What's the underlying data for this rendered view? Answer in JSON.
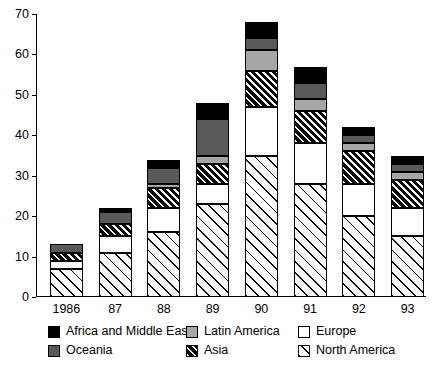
{
  "chart_data": {
    "type": "bar",
    "title": "",
    "subtitle": "",
    "xlabel": "",
    "ylabel": "",
    "stacked": true,
    "grid": false,
    "legend_position": "bottom",
    "categories": [
      "1986",
      "87",
      "88",
      "89",
      "90",
      "91",
      "92",
      "93"
    ],
    "ylim": [
      0,
      70
    ],
    "yticks": [
      0,
      10,
      20,
      30,
      40,
      50,
      60,
      70
    ],
    "ytick_labels": [
      "0",
      "10",
      "20",
      "30",
      "40",
      "50",
      "60",
      "70"
    ],
    "series": [
      {
        "name": "North America",
        "key": "north",
        "values": [
          7,
          11,
          16,
          23,
          35,
          28,
          20,
          15
        ]
      },
      {
        "name": "Europe",
        "key": "europe",
        "values": [
          2,
          4,
          6,
          5,
          12,
          10,
          8,
          7
        ]
      },
      {
        "name": "Asia",
        "key": "asia",
        "values": [
          2,
          3,
          5,
          5,
          9,
          8,
          8,
          7
        ]
      },
      {
        "name": "Latin America",
        "key": "latin",
        "values": [
          0,
          0,
          1,
          2,
          5,
          3,
          2,
          2
        ]
      },
      {
        "name": "Oceania",
        "key": "oceania",
        "values": [
          2,
          3,
          4,
          9,
          3,
          4,
          2,
          2
        ]
      },
      {
        "name": "Africa and Middle East",
        "key": "africa",
        "values": [
          0,
          1,
          2,
          4,
          4,
          4,
          2,
          2
        ]
      }
    ],
    "totals": [
      13,
      22,
      34,
      48,
      68,
      57,
      42,
      35
    ]
  },
  "legend": {
    "rows": [
      [
        {
          "label": "Africa and Middle East",
          "key": "africa"
        },
        {
          "label": "Latin America",
          "key": "latin"
        },
        {
          "label": "Europe",
          "key": "europe"
        }
      ],
      [
        {
          "label": "Oceania",
          "key": "oceania"
        },
        {
          "label": "Asia",
          "key": "asia"
        },
        {
          "label": "North America",
          "key": "north"
        }
      ]
    ]
  },
  "colors": {
    "africa": "#000000",
    "oceania": "#595959",
    "latin": "#a6a6a6",
    "europe": "#ffffff",
    "asia": "#000000",
    "north": "#ffffff",
    "axis": "#000000",
    "background": "#ffffff"
  }
}
